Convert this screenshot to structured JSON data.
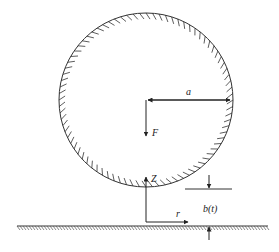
{
  "diagram": {
    "colors": {
      "stroke": "#333333",
      "background": "#ffffff"
    },
    "labels": {
      "radius": "a",
      "force": "F",
      "axial": "Z",
      "radial": "r",
      "gap": "b(t)"
    },
    "sphere": {
      "cx": 146,
      "cy": 100,
      "r": 87,
      "hatched": true
    },
    "wall": {
      "y": 226,
      "x1": 17,
      "x2": 268,
      "hatched": true
    }
  }
}
